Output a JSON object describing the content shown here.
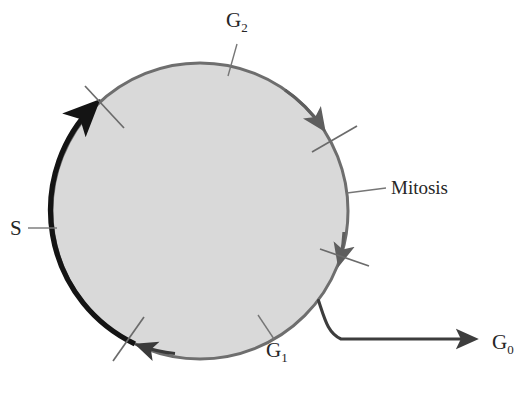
{
  "diagram": {
    "type": "cycle-diagram",
    "colors": {
      "cycle_fill": "#d9d9d9",
      "cycle_stroke": "#6e6e6e",
      "s_phase_stroke": "#141414",
      "g1_stroke": "#3a3a3a",
      "leader_line": "#767676",
      "tick": "#6b6b6b",
      "background": "#ffffff",
      "text": "#262626"
    },
    "geometry": {
      "center_x": 200,
      "center_y": 211,
      "radius": 148
    }
  },
  "labels": {
    "g2": {
      "text": "G",
      "subscript": "2"
    },
    "g1": {
      "text": "G",
      "subscript": "1"
    },
    "g0": {
      "text": "G",
      "subscript": "0"
    },
    "s": {
      "text": "S"
    },
    "mitosis": {
      "text": "Mitosis"
    }
  }
}
